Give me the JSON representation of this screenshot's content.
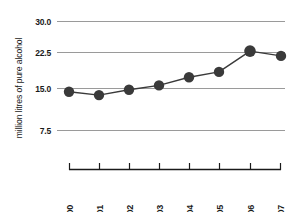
{
  "chart_data": {
    "type": "line",
    "title": "",
    "subtitle": "",
    "xlabel": "",
    "ylabel": "million litres of pure alcohol",
    "categories": [
      "2000",
      "2001",
      "2002",
      "2003",
      "2004",
      "2005",
      "2006",
      "2007"
    ],
    "x": [
      2000,
      2001,
      2002,
      2003,
      2004,
      2005,
      2006,
      2007
    ],
    "values": [
      15.5,
      14.8,
      15.9,
      16.8,
      18.5,
      19.6,
      23.9,
      22.9
    ],
    "series": [
      {
        "name": "million litres of pure alcohol",
        "values": [
          15.5,
          14.8,
          15.9,
          16.8,
          18.5,
          19.6,
          23.9,
          22.9
        ]
      }
    ],
    "ylim": [
      0,
      30
    ],
    "yticks": [
      7.5,
      15.0,
      22.5,
      30.0
    ],
    "ytick_labels": [
      "7.5",
      "15.0",
      "22.5",
      "30.0"
    ],
    "xtick_labels": [
      "2000",
      "2001",
      "2002",
      "2003",
      "2004",
      "2005",
      "2006",
      "2007"
    ],
    "grid": true,
    "grid_axis": "y",
    "legend": false,
    "legend_position": "none",
    "marker": "circle",
    "colors": {
      "marker": "#3a3a3a",
      "line": "#3a3a3a",
      "grid": "#9a9a9a",
      "axis": "#1a1a1a",
      "text": "#1a1a1a",
      "background": "#ffffff"
    },
    "annotations": []
  },
  "axes": {
    "y_axis_title": "million litres of pure alcohol",
    "y_tick_labels": [
      "30.0",
      "22.5",
      "15.0",
      "7.5"
    ],
    "x_tick_labels": [
      "2000",
      "2001",
      "2002",
      "2003",
      "2004",
      "2005",
      "2006",
      "2007"
    ]
  }
}
